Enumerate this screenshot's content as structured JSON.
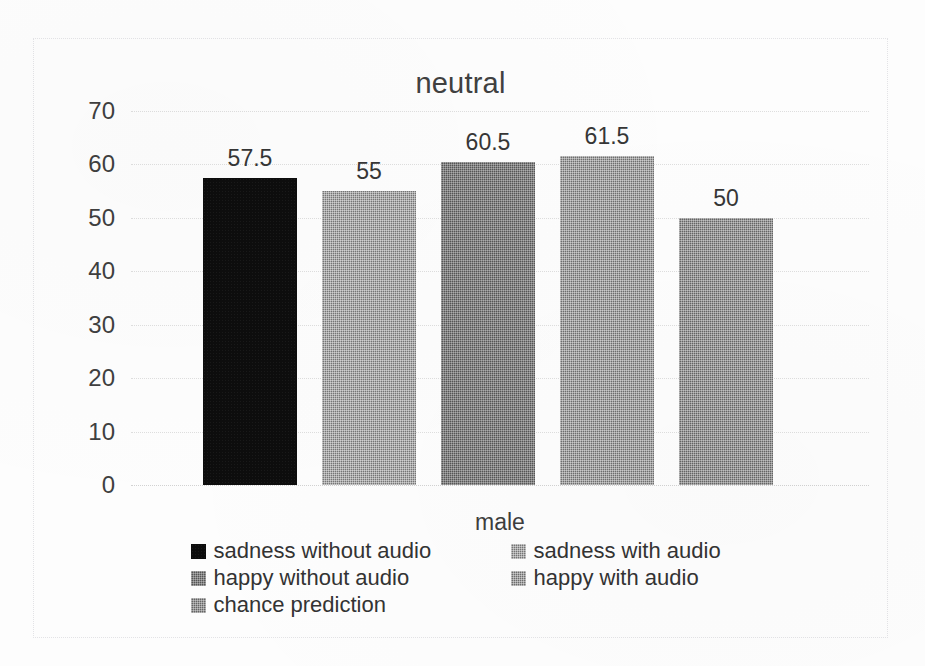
{
  "chart_data": {
    "type": "bar",
    "title": "neutral",
    "xlabel": "male",
    "ylabel": "",
    "categories": [
      "male"
    ],
    "ylim": [
      0,
      70
    ],
    "yticks": [
      70,
      60,
      50,
      40,
      30,
      20,
      10,
      0
    ],
    "grid": true,
    "legend_position": "bottom",
    "series": [
      {
        "name": "sadness without audio",
        "values": [
          57.5
        ],
        "label": "57.5",
        "color": "#0d0d0d",
        "fill_class": "fill-black"
      },
      {
        "name": "sadness with audio",
        "values": [
          55
        ],
        "label": "55",
        "color": "#767676",
        "fill_class": "fill-grey1"
      },
      {
        "name": "happy without audio",
        "values": [
          60.5
        ],
        "label": "60.5",
        "color": "#555555",
        "fill_class": "fill-grey2"
      },
      {
        "name": "happy with audio",
        "values": [
          61.5
        ],
        "label": "61.5",
        "color": "#6e6e6e",
        "fill_class": "fill-grey3"
      },
      {
        "name": "chance prediction",
        "values": [
          50
        ],
        "label": "50",
        "color": "#656565",
        "fill_class": "fill-grey4"
      }
    ]
  },
  "legend": {
    "rows": [
      {
        "left": "sadness without audio",
        "right": "sadness with audio"
      },
      {
        "left": "happy without audio",
        "right": "happy with audio"
      },
      {
        "left": "chance prediction",
        "right": ""
      }
    ]
  }
}
